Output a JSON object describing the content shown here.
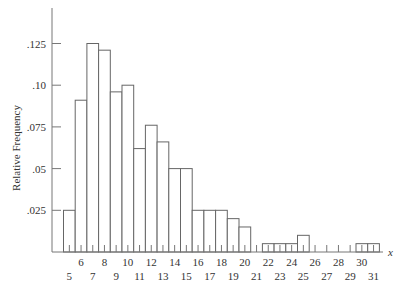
{
  "chart_data": {
    "type": "bar",
    "title": "",
    "xlabel": "x",
    "ylabel": "Relative Frequency",
    "categories": [
      5,
      6,
      7,
      8,
      9,
      10,
      11,
      12,
      13,
      14,
      15,
      16,
      17,
      18,
      19,
      20,
      21,
      22,
      23,
      24,
      25,
      26,
      27,
      28,
      29,
      30,
      31
    ],
    "values": [
      0.025,
      0.091,
      0.125,
      0.121,
      0.096,
      0.1,
      0.062,
      0.076,
      0.066,
      0.05,
      0.05,
      0.025,
      0.025,
      0.025,
      0.02,
      0.015,
      0,
      0.005,
      0.005,
      0.005,
      0.01,
      0,
      0,
      0,
      0,
      0.005,
      0.005
    ],
    "ylim": [
      0,
      0.145
    ],
    "yticks": [
      ".025",
      ".05",
      ".075",
      ".10",
      ".125"
    ],
    "ytick_values": [
      0.025,
      0.05,
      0.075,
      0.1,
      0.125
    ],
    "xtick_labels_upper": [
      "6",
      "8",
      "10",
      "12",
      "14",
      "16",
      "18",
      "20",
      "22",
      "24",
      "26",
      "28",
      "30"
    ],
    "xtick_labels_lower": [
      "5",
      "7",
      "9",
      "11",
      "13",
      "15",
      "17",
      "19",
      "21",
      "23",
      "25",
      "27",
      "29",
      "31"
    ],
    "grid": false,
    "legend": null
  }
}
